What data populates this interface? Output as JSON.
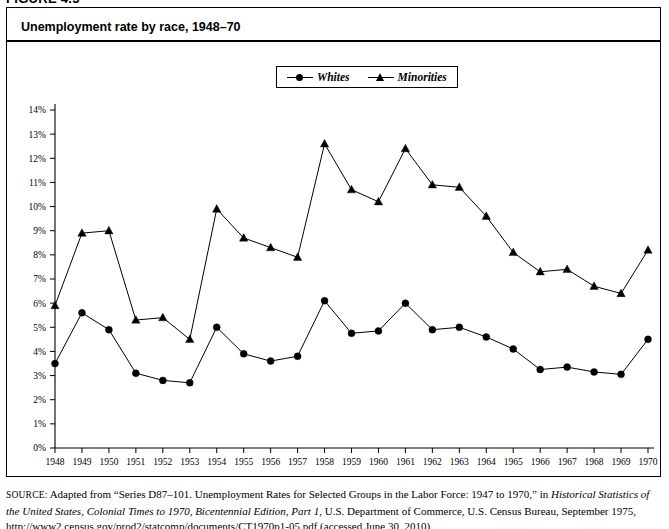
{
  "figure": {
    "label": "FIGURE 4.5",
    "title": "Unemployment rate by race, 1948–70"
  },
  "legend": {
    "position": "top-center",
    "items": [
      {
        "label": "Whites",
        "marker": "circle-marker-icon",
        "color": "#000000"
      },
      {
        "label": "Minorities",
        "marker": "triangle-marker-icon",
        "color": "#000000"
      }
    ]
  },
  "source": {
    "prefix": "SOURCE:",
    "part1": " Adapted from “Series D87–101. Unemployment Rates for Selected Groups in the Labor Force: 1947 to 1970,” in ",
    "italic1": "Historical Statistics of the United States, Colonial Times to 1970, Bicentennial Edition, Part 1",
    "part2": ", U.S. Department of Commerce, U.S. Census Bureau, September 1975, http://www2.census.gov/prod2/statcomp/documents/CT1970p1-05.pdf (accessed June 30, 2010)"
  },
  "chart_data": {
    "type": "line",
    "title": "Unemployment rate by race, 1948–70",
    "xlabel": "",
    "ylabel": "",
    "grid": false,
    "legend_position": "top-center",
    "x": [
      1948,
      1949,
      1950,
      1951,
      1952,
      1953,
      1954,
      1955,
      1956,
      1957,
      1958,
      1959,
      1960,
      1961,
      1962,
      1963,
      1964,
      1965,
      1966,
      1967,
      1968,
      1969,
      1970
    ],
    "xtick_labels": [
      "1948",
      "1949",
      "1950",
      "1951",
      "1952",
      "1953",
      "1954",
      "1955",
      "1956",
      "1957",
      "1958",
      "1959",
      "1960",
      "1961",
      "1962",
      "1963",
      "1964",
      "1965",
      "1966",
      "1967",
      "1968",
      "1969",
      "1970"
    ],
    "xlim": [
      1948,
      1970
    ],
    "ylim": [
      0,
      14
    ],
    "ytick_labels": [
      "0%",
      "1%",
      "2%",
      "3%",
      "4%",
      "5%",
      "6%",
      "7%",
      "8%",
      "9%",
      "10%",
      "11%",
      "12%",
      "13%",
      "14%"
    ],
    "ytick_values": [
      0,
      1,
      2,
      3,
      4,
      5,
      6,
      7,
      8,
      9,
      10,
      11,
      12,
      13,
      14
    ],
    "series": [
      {
        "name": "Whites",
        "marker": "circle",
        "color": "#000000",
        "values": [
          3.5,
          5.6,
          4.9,
          3.1,
          2.8,
          2.7,
          5.0,
          3.9,
          3.6,
          3.8,
          6.1,
          4.75,
          4.85,
          6.0,
          4.9,
          5.0,
          4.6,
          4.1,
          3.25,
          3.35,
          3.15,
          3.05,
          4.5
        ]
      },
      {
        "name": "Minorities",
        "marker": "triangle",
        "color": "#000000",
        "values": [
          5.9,
          8.9,
          9.0,
          5.3,
          5.4,
          4.5,
          9.9,
          8.7,
          8.3,
          7.9,
          12.6,
          10.7,
          10.2,
          12.4,
          10.9,
          10.8,
          9.6,
          8.1,
          7.3,
          7.4,
          6.7,
          6.4,
          8.2
        ]
      }
    ]
  }
}
